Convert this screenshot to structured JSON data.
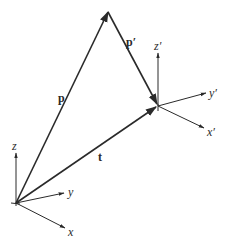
{
  "diagram": {
    "title": "",
    "frames": [
      {
        "id": "world",
        "origin": [
          16,
          203
        ],
        "axes": [
          {
            "name": "z",
            "label": "z",
            "end": [
              16,
              153
            ],
            "label_pos": [
              12,
              150
            ]
          },
          {
            "name": "y",
            "label": "y",
            "end": [
              64,
              193
            ],
            "label_pos": [
              68,
              196
            ]
          },
          {
            "name": "x",
            "label": "x",
            "end": [
              65,
              228
            ],
            "label_pos": [
              68,
              236
            ]
          }
        ]
      },
      {
        "id": "local",
        "origin": [
          158,
          106
        ],
        "axes": [
          {
            "name": "z-prime",
            "label": "z′",
            "end": [
              158,
              53
            ],
            "label_pos": [
              154,
              50
            ]
          },
          {
            "name": "y-prime",
            "label": "y′",
            "end": [
              206,
              93
            ],
            "label_pos": [
              209,
              97
            ]
          },
          {
            "name": "x-prime",
            "label": "x′",
            "end": [
              204,
              128
            ],
            "label_pos": [
              207,
              136
            ]
          }
        ]
      }
    ],
    "vectors": [
      {
        "name": "p",
        "label": "p",
        "from": [
          16,
          203
        ],
        "to": [
          108,
          12
        ],
        "label_pos": [
          58,
          102
        ]
      },
      {
        "name": "p-prime",
        "label": "p′",
        "from": [
          108,
          12
        ],
        "to": [
          157,
          104
        ],
        "label_pos": [
          126,
          46
        ]
      },
      {
        "name": "t",
        "label": "t",
        "from": [
          16,
          203
        ],
        "to": [
          156,
          107
        ],
        "label_pos": [
          98,
          161
        ]
      }
    ],
    "colors": {
      "line": "#2a2a2a",
      "background": "#ffffff"
    }
  }
}
